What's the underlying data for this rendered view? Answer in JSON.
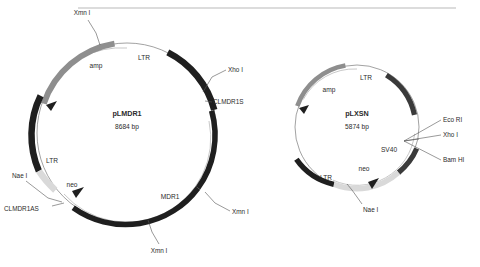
{
  "figure": {
    "type": "plasmid-map-diagram",
    "background": "#ffffff",
    "divider_rule": {
      "x1": 78,
      "y1": 8,
      "x2": 456,
      "y2": 8,
      "color": "#b9b9b9"
    }
  },
  "colors": {
    "black_feature": "#1f1f1f",
    "dark_gray_feature": "#3a3a3a",
    "mid_gray_feature": "#8e8e8e",
    "light_gray_feature": "#d9d9d9",
    "backbone": "#7a7a7a",
    "leader_line": "#555555",
    "text": "#2b2b2b"
  },
  "plasmids": [
    {
      "id": "plmdr1",
      "name": "pLMDR1",
      "size": "8684 bp",
      "center": {
        "x": 127,
        "y": 133
      },
      "radius": 90,
      "features": [
        {
          "name": "amp",
          "label": "amp",
          "color": "#8e8e8e",
          "start_deg": 262,
          "end_deg": 318,
          "label_x": 96,
          "label_y": 68,
          "arrow": "ccw"
        },
        {
          "name": "LTR-top",
          "label": "LTR",
          "color": "#1f1f1f",
          "start_deg": 333,
          "end_deg": 22,
          "label_x": 144,
          "label_y": 57,
          "arrow": "none"
        },
        {
          "name": "MDR1",
          "label": "MDR1",
          "color": "#1f1f1f",
          "start_deg": 38,
          "end_deg": 150,
          "label_x": 170,
          "label_y": 199,
          "arrow": "none"
        },
        {
          "name": "LTR-left",
          "label": "LTR",
          "color": "#1f1f1f",
          "start_deg": 190,
          "end_deg": 222,
          "label_x": 52,
          "label_y": 161,
          "arrow": "none"
        },
        {
          "name": "neo",
          "label": "neo",
          "color": "#d9d9d9",
          "start_deg": 152,
          "end_deg": 190,
          "label_x": 70,
          "label_y": 187,
          "arrow": "ccw"
        }
      ],
      "sites": [
        {
          "label": "Xmn I",
          "text_x": 82,
          "text_y": 15,
          "anchor": "middle"
        },
        {
          "label": "Xho I",
          "text_x": 228,
          "text_y": 72,
          "anchor": "start"
        },
        {
          "label": "CLMDR1S",
          "text_x": 213,
          "text_y": 104,
          "anchor": "start"
        },
        {
          "label": "Xmn I",
          "text_x": 232,
          "text_y": 214,
          "anchor": "start"
        },
        {
          "label": "Xmn I",
          "text_x": 159,
          "text_y": 253,
          "anchor": "middle"
        },
        {
          "label": "Nae I",
          "text_x": 12,
          "text_y": 178,
          "anchor": "start"
        },
        {
          "label": "CLMDR1AS",
          "text_x": 4,
          "text_y": 211,
          "anchor": "start"
        }
      ]
    },
    {
      "id": "plxsn",
      "name": "pLXSN",
      "size": "5874 bp",
      "center": {
        "x": 357,
        "y": 127
      },
      "radius": 62,
      "features": [
        {
          "name": "LTR-top",
          "label": "LTR",
          "color": "#3a3a3a",
          "start_deg": 326,
          "end_deg": 16,
          "label_x": 366,
          "label_y": 78,
          "arrow": "none"
        },
        {
          "name": "amp",
          "label": "amp",
          "color": "#8e8e8e",
          "start_deg": 250,
          "end_deg": 312,
          "label_x": 329,
          "label_y": 90,
          "arrow": "ccw"
        },
        {
          "name": "SV40",
          "label": "SV40",
          "color": "#3a3a3a",
          "start_deg": 48,
          "end_deg": 88,
          "label_x": 390,
          "label_y": 150,
          "arrow": "none"
        },
        {
          "name": "neo",
          "label": "neo",
          "color": "#d9d9d9",
          "start_deg": 90,
          "end_deg": 142,
          "label_x": 365,
          "label_y": 170,
          "arrow": "ccw"
        },
        {
          "name": "LTR-bottom",
          "label": "LTR",
          "color": "#1f1f1f",
          "start_deg": 148,
          "end_deg": 186,
          "label_x": 327,
          "label_y": 178,
          "arrow": "none"
        }
      ],
      "sites": [
        {
          "label": "Eco RI",
          "text_x": 443,
          "text_y": 122,
          "anchor": "start"
        },
        {
          "label": "Xho I",
          "text_x": 443,
          "text_y": 137,
          "anchor": "start"
        },
        {
          "label": "Bam HI",
          "text_x": 443,
          "text_y": 162,
          "anchor": "start"
        },
        {
          "label": "Nae I",
          "text_x": 363,
          "text_y": 212,
          "anchor": "start"
        }
      ]
    }
  ]
}
